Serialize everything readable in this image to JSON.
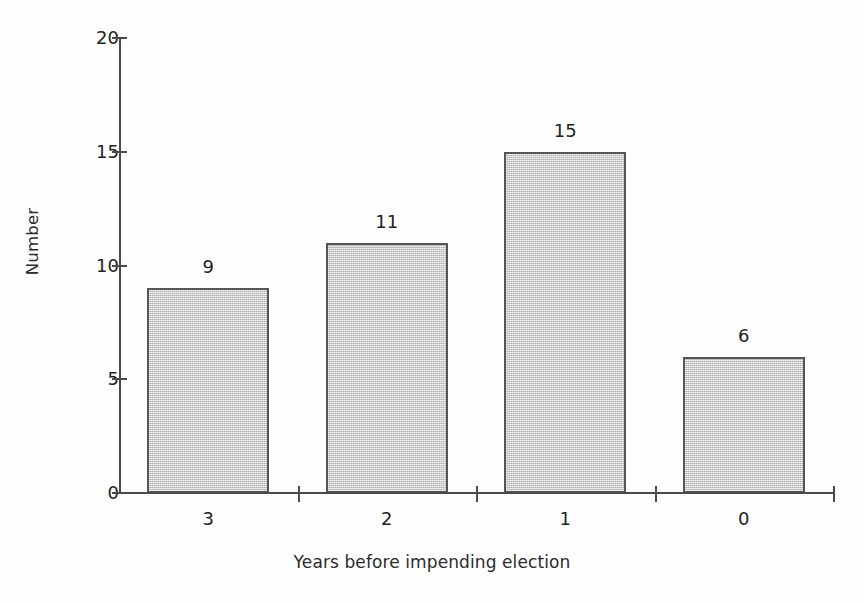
{
  "chart_data": {
    "type": "bar",
    "title": "",
    "categories": [
      "3",
      "2",
      "1",
      "0"
    ],
    "values": [
      9,
      11,
      15,
      6
    ],
    "value_labels": [
      "9",
      "11",
      "15",
      "6"
    ],
    "xlabel": "Years before impending election",
    "ylabel": "Number",
    "ylim": [
      0,
      20
    ],
    "ytick_labels": [
      "0",
      "5",
      "10",
      "15",
      "20"
    ],
    "ytick_values": [
      0,
      5,
      10,
      15,
      20
    ],
    "grid": false,
    "legend": null,
    "bar_fill_color": "#c9c9c9",
    "bar_border_color": "#555555",
    "axis_color": "#4a4a4a",
    "text_color": "#222222"
  }
}
